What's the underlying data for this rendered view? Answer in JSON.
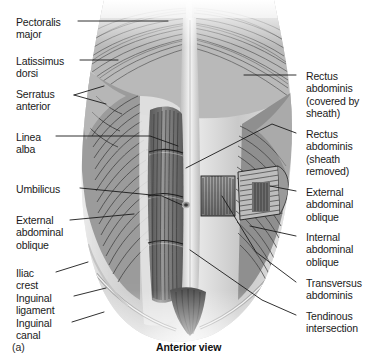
{
  "figure": {
    "title": "Anterior view",
    "panel_label": "(a)",
    "view_caption": "Anterior view",
    "style": "grayscale anatomical illustration"
  },
  "labels_left": [
    {
      "id": "pectoralis-major",
      "text": "Pectoralis\nmajor",
      "x": 16,
      "y": 16
    },
    {
      "id": "latissimus-dorsi",
      "text": "Latissimus\ndorsi",
      "x": 16,
      "y": 55
    },
    {
      "id": "serratus-anterior",
      "text": "Serratus\nanterior",
      "x": 16,
      "y": 88
    },
    {
      "id": "linea-alba",
      "text": "Linea\nalba",
      "x": 16,
      "y": 131
    },
    {
      "id": "umbilicus",
      "text": "Umbilicus",
      "x": 16,
      "y": 183
    },
    {
      "id": "external-abdominal-oblique-left",
      "text": "External\nabdominal\noblique",
      "x": 16,
      "y": 214
    },
    {
      "id": "iliac-crest",
      "text": "Iliac\ncrest",
      "x": 16,
      "y": 267
    },
    {
      "id": "inguinal-ligament",
      "text": "Inguinal\nligament",
      "x": 16,
      "y": 292
    },
    {
      "id": "inguinal-canal",
      "text": "Inguinal\ncanal",
      "x": 16,
      "y": 317
    }
  ],
  "labels_right": [
    {
      "id": "rectus-abdominis-covered",
      "text": "Rectus\nabdominis\n(covered by\nsheath)",
      "x": 306,
      "y": 70
    },
    {
      "id": "rectus-abdominis-removed",
      "text": "Rectus\nabdominis\n(sheath\nremoved)",
      "x": 306,
      "y": 128
    },
    {
      "id": "external-abdominal-oblique-right",
      "text": "External\nabdominal\noblique",
      "x": 306,
      "y": 186
    },
    {
      "id": "internal-abdominal-oblique",
      "text": "Internal\nabdominal\noblique",
      "x": 306,
      "y": 231
    },
    {
      "id": "transversus-abdominis",
      "text": "Transversus\nabdominis",
      "x": 306,
      "y": 277
    },
    {
      "id": "tendinous-intersection",
      "text": "Tendinous\nintersection",
      "x": 306,
      "y": 310
    }
  ],
  "colors": {
    "background": "#ffffff",
    "text": "#1a1a1a",
    "leader_line": "#1a1a1a",
    "illustration_dark": "#3a3a3a",
    "illustration_mid": "#8e8e8e",
    "illustration_light": "#d8d8d8"
  }
}
